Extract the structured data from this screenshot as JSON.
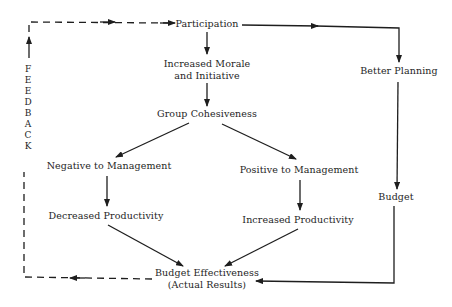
{
  "diagram": {
    "type": "flowchart",
    "nodes": {
      "participation": "Participation",
      "morale_line1": "Increased Morale",
      "morale_line2": "and Initiative",
      "cohesiveness": "Group Cohesiveness",
      "negative": "Negative to Management",
      "positive": "Positive to Management",
      "decreased": "Decreased Productivity",
      "increased": "Increased Productivity",
      "better_planning": "Better Planning",
      "budget": "Budget",
      "effectiveness_line1": "Budget Effectiveness",
      "effectiveness_line2": "(Actual Results)"
    },
    "feedback_letters": [
      "F",
      "E",
      "E",
      "D",
      "B",
      "A",
      "C",
      "K"
    ],
    "feedback_label": "FEEDBACK",
    "edges": [
      {
        "from": "participation",
        "to": "morale",
        "style": "solid"
      },
      {
        "from": "morale",
        "to": "cohesiveness",
        "style": "solid"
      },
      {
        "from": "cohesiveness",
        "to": "negative",
        "style": "solid"
      },
      {
        "from": "cohesiveness",
        "to": "positive",
        "style": "solid"
      },
      {
        "from": "negative",
        "to": "decreased",
        "style": "solid"
      },
      {
        "from": "positive",
        "to": "increased",
        "style": "solid"
      },
      {
        "from": "decreased",
        "to": "effectiveness",
        "style": "solid"
      },
      {
        "from": "increased",
        "to": "effectiveness",
        "style": "solid"
      },
      {
        "from": "participation",
        "to": "better_planning",
        "style": "solid"
      },
      {
        "from": "better_planning",
        "to": "budget",
        "style": "solid"
      },
      {
        "from": "budget",
        "to": "effectiveness",
        "style": "solid"
      },
      {
        "from": "effectiveness",
        "to": "participation",
        "style": "dashed",
        "label": "FEEDBACK"
      }
    ],
    "colors": {
      "line": "#1e1e1e",
      "text": "#1e1e1e",
      "background": "#ffffff"
    }
  }
}
